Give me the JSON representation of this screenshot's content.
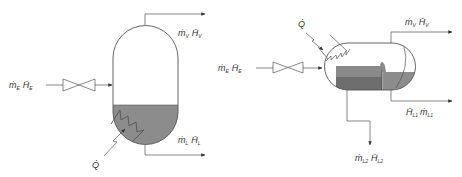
{
  "colors": {
    "line": "#555555",
    "liquid": "#8c8c8c",
    "liquid_dark": "#6e6e6e",
    "liquid_layer": "#7a7a7a",
    "background": "#ffffff",
    "text": "#333333"
  },
  "left_diagram": {
    "title": "Vertical flash drum",
    "feed_label": {
      "symbol": "ṁ",
      "sub": "E",
      "enth": "H̄",
      "enth_sub": "E"
    },
    "vapor_label": {
      "symbol": "ṁ",
      "sub": "V",
      "enth": "H̄",
      "enth_sub": "V"
    },
    "liquid_label": {
      "symbol": "ṁ",
      "sub": "L",
      "enth": "H̄",
      "enth_sub": "L"
    },
    "heat_label": "Q̇"
  },
  "right_diagram": {
    "title": "Horizontal flash drum with weir",
    "feed_label": {
      "symbol": "ṁ",
      "sub": "E",
      "enth": "H̄",
      "enth_sub": "E"
    },
    "vapor_label": {
      "symbol": "ṁ",
      "sub": "V",
      "enth": "H̄",
      "enth_sub": "V"
    },
    "liquid1_label": {
      "enth": "H̄",
      "enth_sub": "L1",
      "symbol": "ṁ",
      "sub": "L1"
    },
    "liquid2_label": {
      "symbol": "ṁ",
      "sub": "L2",
      "enth": "H̄",
      "enth_sub": "L2"
    },
    "heat_label": "Q̇"
  }
}
